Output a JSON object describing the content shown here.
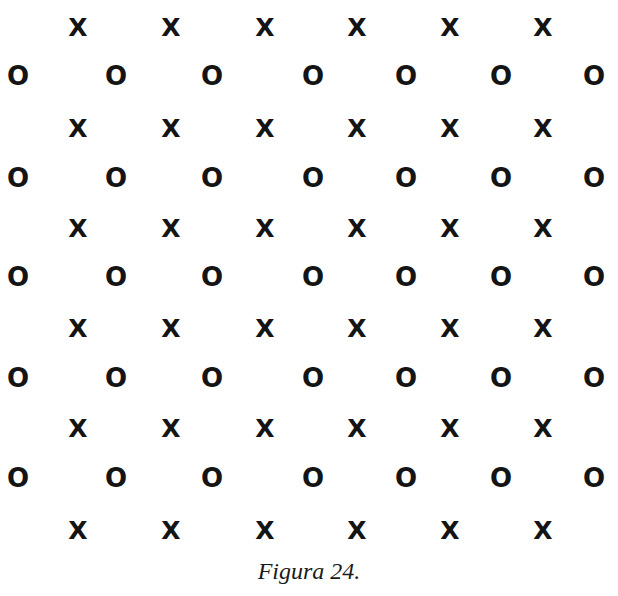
{
  "figure": {
    "caption": "Figura 24.",
    "x_symbol": "X",
    "o_symbol": "O",
    "x_rows": 6,
    "o_rows": 5,
    "x_per_row": 6,
    "o_per_row": 7,
    "x_columns_px": [
      78,
      171,
      265,
      357,
      450,
      543
    ],
    "o_columns_px": [
      18,
      116,
      212,
      313,
      406,
      501,
      594
    ],
    "x_rows_px": [
      27,
      128,
      228,
      328,
      428,
      530
    ],
    "o_rows_px": [
      76,
      178,
      277,
      378,
      478
    ],
    "color": "#141414"
  }
}
